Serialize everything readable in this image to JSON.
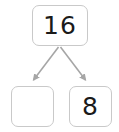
{
  "diagram": {
    "type": "number-bond",
    "background_color": "#ffffff",
    "box_border_color": "#c9c9c9",
    "arrow_color": "#a6a6a6",
    "text_color": "#1a1a1a",
    "whole": {
      "label": "16",
      "value": "16",
      "role": "whole",
      "empty": false
    },
    "parts": [
      {
        "label": "",
        "value": "",
        "role": "part-left",
        "empty": true
      },
      {
        "label": "8",
        "value": "8",
        "role": "part-right",
        "empty": false
      }
    ],
    "connectors": [
      {
        "name": "arrow-to-left-part",
        "from": "whole",
        "to": "part-left",
        "style": "solid-arrow"
      },
      {
        "name": "arrow-to-right-part",
        "from": "whole",
        "to": "part-right",
        "style": "solid-arrow"
      }
    ]
  }
}
